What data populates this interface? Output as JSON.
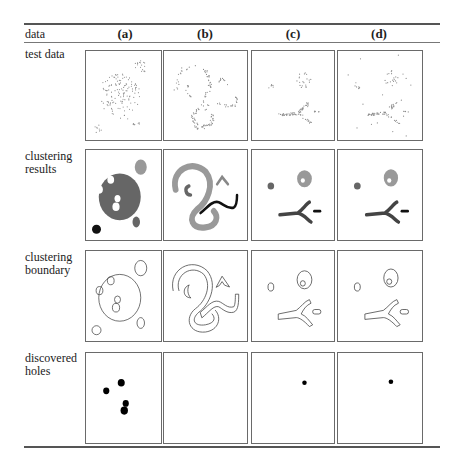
{
  "table": {
    "header_label": "data",
    "columns": [
      "(a)",
      "(b)",
      "(c)",
      "(d)"
    ],
    "rows": [
      {
        "label": "test data"
      },
      {
        "label": "clustering results"
      },
      {
        "label": "clustering boundary"
      },
      {
        "label": "discovered holes"
      }
    ]
  },
  "colors": {
    "rule": "#555555",
    "panel_border": "#6a6a6a",
    "points": "#8a8a8a",
    "cluster_dark": "#666666",
    "cluster_light": "#999999",
    "cluster_black": "#111111",
    "boundary": "#444444",
    "hole": "#000000"
  },
  "holes": {
    "a": [
      [
        0.27,
        0.42,
        0.075
      ],
      [
        0.47,
        0.33,
        0.085
      ],
      [
        0.53,
        0.56,
        0.075
      ],
      [
        0.51,
        0.64,
        0.09
      ]
    ],
    "b": [],
    "c": [
      [
        0.64,
        0.33,
        0.05
      ]
    ],
    "d": [
      [
        0.63,
        0.32,
        0.05
      ]
    ]
  }
}
